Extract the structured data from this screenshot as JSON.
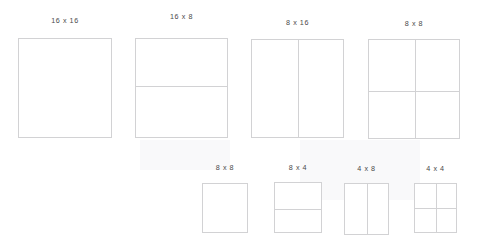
{
  "diagram": {
    "line_color": "#d2d2d4",
    "label_color": "#4a4a4a",
    "background_color": "#ffffff",
    "rows": [
      {
        "name": "top-row",
        "blocks": [
          {
            "label": "16 x 16",
            "width_units": 16,
            "height_units": 16,
            "cols": 1,
            "rows": 1,
            "x": 18,
            "y": 38,
            "w": 94,
            "h": 100,
            "label_y": 16
          },
          {
            "label": "16 x 8",
            "width_units": 16,
            "height_units": 8,
            "cols": 1,
            "rows": 2,
            "x": 135,
            "y": 38,
            "w": 93,
            "h": 100,
            "label_y": 12,
            "h_divider_pct": 48
          },
          {
            "label": "8 x 16",
            "width_units": 8,
            "height_units": 16,
            "cols": 2,
            "rows": 1,
            "x": 251,
            "y": 39,
            "w": 93,
            "h": 99,
            "label_y": 18,
            "v_divider_pct": 50
          },
          {
            "label": "8 x 8",
            "width_units": 8,
            "height_units": 8,
            "cols": 2,
            "rows": 2,
            "x": 368,
            "y": 39,
            "w": 92,
            "h": 100,
            "label_y": 19,
            "v_divider_pct": 51,
            "h_divider_pct": 52
          }
        ]
      },
      {
        "name": "bottom-row",
        "blocks": [
          {
            "label": "8 x 8",
            "width_units": 8,
            "height_units": 8,
            "cols": 1,
            "rows": 1,
            "x": 202,
            "y": 183,
            "w": 46,
            "h": 50,
            "label_y": 163
          },
          {
            "label": "8 x 4",
            "width_units": 8,
            "height_units": 4,
            "cols": 1,
            "rows": 2,
            "x": 274,
            "y": 182,
            "w": 48,
            "h": 51,
            "label_y": 163,
            "h_divider_pct": 53
          },
          {
            "label": "4 x 8",
            "width_units": 4,
            "height_units": 8,
            "cols": 2,
            "rows": 1,
            "x": 344,
            "y": 183,
            "w": 45,
            "h": 52,
            "label_y": 164,
            "v_divider_pct": 50
          },
          {
            "label": "4 x 4",
            "width_units": 4,
            "height_units": 4,
            "cols": 2,
            "rows": 2,
            "x": 414,
            "y": 183,
            "w": 43,
            "h": 50,
            "label_y": 164,
            "v_divider_pct": 50,
            "h_divider_pct": 50
          }
        ]
      }
    ]
  }
}
